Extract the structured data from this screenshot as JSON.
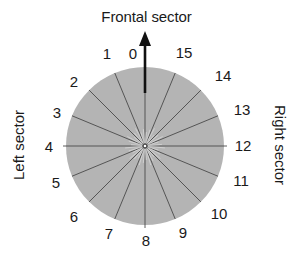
{
  "diagram": {
    "title": "Frontal sector",
    "left_label": "Left sector",
    "right_label": "Right sector",
    "circle": {
      "cx": 145,
      "cy": 146,
      "r": 79,
      "fill": "#b4b4b4",
      "line_color": "#4a4a4a",
      "sector_count": 16
    },
    "arrow": {
      "color": "#111111",
      "direction": "up"
    },
    "sectors": [
      {
        "label": "0",
        "x": 133,
        "y": 54
      },
      {
        "label": "1",
        "x": 107,
        "y": 54
      },
      {
        "label": "2",
        "x": 74,
        "y": 82
      },
      {
        "label": "3",
        "x": 57,
        "y": 113
      },
      {
        "label": "4",
        "x": 49,
        "y": 147
      },
      {
        "label": "5",
        "x": 56,
        "y": 183
      },
      {
        "label": "6",
        "x": 74,
        "y": 217
      },
      {
        "label": "7",
        "x": 109,
        "y": 234
      },
      {
        "label": "8",
        "x": 146,
        "y": 241
      },
      {
        "label": "9",
        "x": 183,
        "y": 233
      },
      {
        "label": "10",
        "x": 219,
        "y": 214
      },
      {
        "label": "11",
        "x": 241,
        "y": 181
      },
      {
        "label": "12",
        "x": 243,
        "y": 146
      },
      {
        "label": "13",
        "x": 242,
        "y": 110
      },
      {
        "label": "14",
        "x": 223,
        "y": 76
      },
      {
        "label": "15",
        "x": 184,
        "y": 53
      }
    ]
  }
}
